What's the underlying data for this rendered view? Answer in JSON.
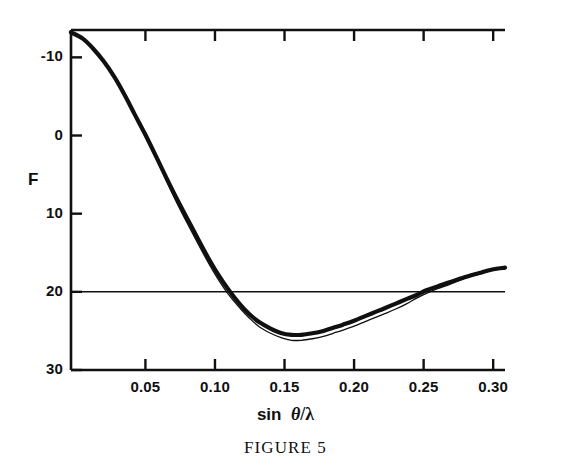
{
  "figure": {
    "caption": "FIGURE 5",
    "background_color": "#ffffff",
    "ink_color": "#101010"
  },
  "axes": {
    "y_title": "F",
    "x_title_prefix": "sin",
    "x_title_theta": "θ",
    "x_title_slash": "/",
    "x_title_lambda": "λ",
    "x_tick_labels": [
      "0.05",
      "0.10",
      "0.15",
      "0.20",
      "0.25",
      "0.30"
    ],
    "y_tick_labels": [
      "30",
      "20",
      "10",
      "0",
      "-10"
    ]
  },
  "chart_data": {
    "type": "line",
    "title": "FIGURE 5",
    "xlabel": "sin θ/λ",
    "ylabel": "F",
    "xlim": [
      -0.0035,
      0.3085
    ],
    "ylim": [
      -10,
      33.5
    ],
    "xticks": [
      0.05,
      0.1,
      0.15,
      0.2,
      0.25,
      0.3
    ],
    "yticks": [
      -10,
      0,
      10,
      20,
      30
    ],
    "grid": false,
    "legend": null,
    "zero_line": 0,
    "series": [
      {
        "name": "thick-curve",
        "style": "solid",
        "linewidth": 4.2,
        "color": "#101010",
        "x": [
          -0.0035,
          0.005,
          0.012,
          0.02,
          0.028,
          0.035,
          0.042,
          0.05,
          0.058,
          0.065,
          0.072,
          0.08,
          0.088,
          0.095,
          0.102,
          0.11,
          0.118,
          0.125,
          0.132,
          0.14,
          0.148,
          0.155,
          0.162,
          0.17,
          0.178,
          0.185,
          0.192,
          0.2,
          0.208,
          0.215,
          0.222,
          0.23,
          0.238,
          0.245,
          0.252,
          0.26,
          0.268,
          0.275,
          0.282,
          0.29,
          0.298,
          0.3085
        ],
        "y": [
          33.2,
          32.4,
          31.2,
          29.5,
          27.4,
          25.2,
          22.8,
          20.1,
          17.2,
          14.6,
          12.1,
          9.4,
          6.7,
          4.4,
          2.3,
          0.2,
          -1.6,
          -2.9,
          -3.9,
          -4.7,
          -5.3,
          -5.5,
          -5.5,
          -5.3,
          -5.0,
          -4.6,
          -4.2,
          -3.7,
          -3.1,
          -2.6,
          -2.1,
          -1.5,
          -0.9,
          -0.4,
          0.2,
          0.7,
          1.2,
          1.6,
          2.0,
          2.4,
          2.8,
          3.1
        ]
      },
      {
        "name": "thin-curve",
        "style": "solid",
        "linewidth": 1.3,
        "color": "#101010",
        "x": [
          0.042,
          0.05,
          0.058,
          0.065,
          0.072,
          0.08,
          0.088,
          0.095,
          0.102,
          0.11,
          0.118,
          0.125,
          0.132,
          0.14,
          0.148,
          0.155,
          0.162,
          0.17,
          0.178,
          0.185,
          0.192,
          0.2,
          0.208,
          0.215,
          0.222,
          0.23,
          0.238,
          0.245,
          0.252,
          0.26,
          0.268,
          0.275,
          0.282,
          0.29,
          0.298,
          0.3085
        ],
        "y": [
          23.0,
          20.2,
          17.1,
          14.3,
          11.6,
          8.8,
          6.1,
          3.8,
          1.7,
          -0.4,
          -2.1,
          -3.4,
          -4.5,
          -5.3,
          -5.9,
          -6.2,
          -6.2,
          -6.0,
          -5.7,
          -5.3,
          -4.9,
          -4.4,
          -3.8,
          -3.3,
          -2.8,
          -2.2,
          -1.5,
          -0.8,
          -0.2,
          0.4,
          0.9,
          1.4,
          1.9,
          2.3,
          2.7,
          3.0
        ]
      }
    ],
    "annotations": []
  },
  "geometry": {
    "frame_left": 71,
    "frame_right": 505,
    "frame_top": 30,
    "frame_bottom": 370
  }
}
